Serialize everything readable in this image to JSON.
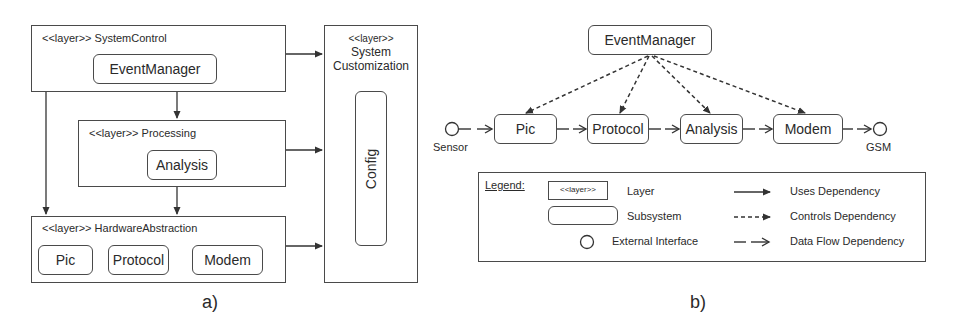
{
  "diagram_a": {
    "caption": "a)",
    "layers": {
      "system_control": {
        "title": "<<layer>> SystemControl",
        "subsystems": [
          "EventManager"
        ]
      },
      "processing": {
        "title": "<<layer>> Processing",
        "subsystems": [
          "Analysis"
        ]
      },
      "hardware_abstraction": {
        "title": "<<layer>> HardwareAbstraction",
        "subsystems": [
          "Pic",
          "Protocol",
          "Modem"
        ]
      },
      "system_customization": {
        "stereotype": "<<layer>>",
        "title_line1": "System",
        "title_line2": "Customization",
        "subsystems": [
          "Config"
        ]
      }
    }
  },
  "diagram_b": {
    "caption": "b)",
    "controller": "EventManager",
    "pipeline": [
      "Pic",
      "Protocol",
      "Analysis",
      "Modem"
    ],
    "interfaces": {
      "input": "Sensor",
      "output": "GSM"
    }
  },
  "legend": {
    "title": "Legend:",
    "layer_sample": "<<layer>>",
    "items": [
      {
        "label": "Layer"
      },
      {
        "label": "Subsystem"
      },
      {
        "label": "External Interface"
      }
    ],
    "dependencies": [
      {
        "label": "Uses Dependency",
        "style": "solid"
      },
      {
        "label": "Controls Dependency",
        "style": "dashed"
      },
      {
        "label": "Data Flow Dependency",
        "style": "long-dash-open"
      }
    ]
  },
  "colors": {
    "line": "#3a3a3a",
    "text": "#2a2a2a",
    "background": "#ffffff"
  }
}
